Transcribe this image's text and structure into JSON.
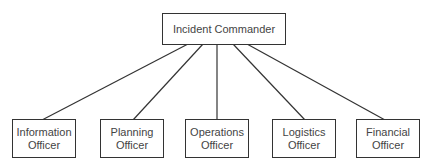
{
  "root": {
    "label": "Incident Commander"
  },
  "children": [
    {
      "line1": "Information",
      "line2": "Officer"
    },
    {
      "line1": "Planning",
      "line2": "Officer"
    },
    {
      "line1": "Operations",
      "line2": "Officer"
    },
    {
      "line1": "Logistics",
      "line2": "Officer"
    },
    {
      "line1": "Financial",
      "line2": "Officer"
    }
  ],
  "colors": {
    "stroke": "#333333",
    "text": "#444444",
    "background": "#ffffff"
  }
}
